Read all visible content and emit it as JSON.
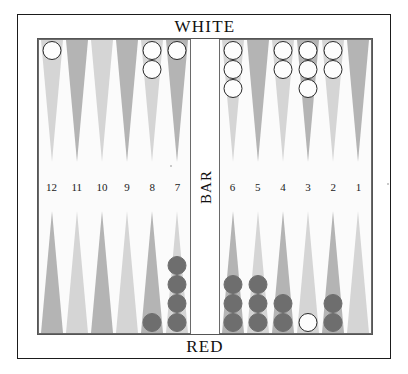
{
  "players": {
    "top_label": "WHITE",
    "bottom_label": "RED"
  },
  "bar": {
    "label": "BAR",
    "white_on_bar": 0,
    "red_on_bar": 0
  },
  "colors": {
    "point_light": "#d5d5d5",
    "point_dark": "#b4b4b4",
    "white_checker": "#fdfdfd",
    "red_checker": "#6e6e6e",
    "board_background": "#fbfbfb",
    "frame": "#1b1b1b",
    "text": "#111111"
  },
  "point_numbers": {
    "left": [
      "12",
      "11",
      "10",
      "9",
      "8",
      "7"
    ],
    "right": [
      "6",
      "5",
      "4",
      "3",
      "2",
      "1"
    ]
  },
  "chart_data": {
    "type": "table",
    "categories": [
      "12",
      "11",
      "10",
      "9",
      "8",
      "7",
      "6",
      "5",
      "4",
      "3",
      "2",
      "1"
    ],
    "series": [
      {
        "name": "WHITE (top row)",
        "values": [
          1,
          0,
          0,
          0,
          2,
          1,
          3,
          0,
          2,
          3,
          2,
          0
        ]
      },
      {
        "name": "RED (bottom row)",
        "values": [
          0,
          0,
          0,
          0,
          1,
          4,
          3,
          3,
          2,
          0,
          2,
          0
        ]
      },
      {
        "name": "WHITE (bottom row)",
        "values": [
          0,
          0,
          0,
          0,
          0,
          0,
          0,
          0,
          0,
          1,
          0,
          0
        ]
      }
    ]
  },
  "top_row": [
    {
      "point": "12",
      "shade": "light",
      "checkers": [
        {
          "color": "white"
        }
      ]
    },
    {
      "point": "11",
      "shade": "dark",
      "checkers": []
    },
    {
      "point": "10",
      "shade": "light",
      "checkers": []
    },
    {
      "point": "9",
      "shade": "dark",
      "checkers": []
    },
    {
      "point": "8",
      "shade": "light",
      "checkers": [
        {
          "color": "white"
        },
        {
          "color": "white"
        }
      ]
    },
    {
      "point": "7",
      "shade": "dark",
      "checkers": [
        {
          "color": "white"
        }
      ]
    },
    {
      "point": "6",
      "shade": "light",
      "checkers": [
        {
          "color": "white"
        },
        {
          "color": "white"
        },
        {
          "color": "white"
        }
      ]
    },
    {
      "point": "5",
      "shade": "dark",
      "checkers": []
    },
    {
      "point": "4",
      "shade": "light",
      "checkers": [
        {
          "color": "white"
        },
        {
          "color": "white"
        }
      ]
    },
    {
      "point": "3",
      "shade": "dark",
      "checkers": [
        {
          "color": "white"
        },
        {
          "color": "white"
        },
        {
          "color": "white"
        }
      ]
    },
    {
      "point": "2",
      "shade": "light",
      "checkers": [
        {
          "color": "white"
        },
        {
          "color": "white"
        }
      ]
    },
    {
      "point": "1",
      "shade": "dark",
      "checkers": []
    }
  ],
  "bottom_row": [
    {
      "point": "12",
      "shade": "dark",
      "checkers": []
    },
    {
      "point": "11",
      "shade": "light",
      "checkers": []
    },
    {
      "point": "10",
      "shade": "dark",
      "checkers": []
    },
    {
      "point": "9",
      "shade": "light",
      "checkers": []
    },
    {
      "point": "8",
      "shade": "dark",
      "checkers": [
        {
          "color": "red"
        }
      ]
    },
    {
      "point": "7",
      "shade": "light",
      "checkers": [
        {
          "color": "red"
        },
        {
          "color": "red"
        },
        {
          "color": "red"
        },
        {
          "color": "red"
        }
      ]
    },
    {
      "point": "6",
      "shade": "dark",
      "checkers": [
        {
          "color": "red"
        },
        {
          "color": "red"
        },
        {
          "color": "red"
        }
      ]
    },
    {
      "point": "5",
      "shade": "light",
      "checkers": [
        {
          "color": "red"
        },
        {
          "color": "red"
        },
        {
          "color": "red"
        }
      ]
    },
    {
      "point": "4",
      "shade": "dark",
      "checkers": [
        {
          "color": "red"
        },
        {
          "color": "red"
        }
      ]
    },
    {
      "point": "3",
      "shade": "light",
      "checkers": [
        {
          "color": "white"
        }
      ]
    },
    {
      "point": "2",
      "shade": "dark",
      "checkers": [
        {
          "color": "red"
        },
        {
          "color": "red"
        }
      ]
    },
    {
      "point": "1",
      "shade": "light",
      "checkers": []
    }
  ]
}
